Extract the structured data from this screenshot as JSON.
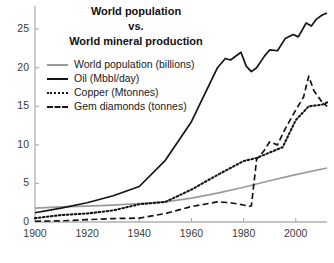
{
  "chart_data": {
    "type": "line",
    "title": "World population\nvs.\nWorld mineral production",
    "title_lines": [
      "World population",
      "vs.",
      "World mineral production"
    ],
    "xlabel": "",
    "ylabel": "",
    "xlim": [
      1900,
      2012
    ],
    "ylim": [
      0,
      28
    ],
    "xticks": [
      1900,
      1920,
      1940,
      1960,
      1980,
      2000
    ],
    "xtick_labels": [
      "1900",
      "1920",
      "1940",
      "1960",
      "1980",
      "2000"
    ],
    "yticks": [
      0,
      5,
      10,
      15,
      20,
      25
    ],
    "ytick_labels": [
      "0",
      "5",
      "10",
      "15",
      "20",
      "25"
    ],
    "grid": false,
    "legend_position": "upper left",
    "series": [
      {
        "name": "World population (billions)",
        "style": "solid",
        "color": "#9a9a9a",
        "x": [
          1900,
          1910,
          1920,
          1930,
          1940,
          1950,
          1960,
          1970,
          1980,
          1990,
          2000,
          2012
        ],
        "values": [
          1.8,
          1.95,
          2.05,
          2.2,
          2.4,
          2.6,
          3.1,
          3.75,
          4.5,
          5.35,
          6.15,
          7.0
        ]
      },
      {
        "name": "Oil (Mbbl/day)",
        "style": "solid",
        "color": "#151515",
        "x": [
          1900,
          1910,
          1920,
          1930,
          1940,
          1950,
          1960,
          1965,
          1970,
          1973,
          1975,
          1979,
          1981,
          1983,
          1985,
          1988,
          1990,
          1993,
          1996,
          1999,
          2001,
          2004,
          2006,
          2008,
          2010,
          2012
        ],
        "values": [
          1.2,
          1.8,
          2.5,
          3.4,
          4.6,
          8.0,
          13.0,
          16.5,
          20.0,
          21.2,
          21.0,
          22.0,
          20.2,
          19.5,
          20.0,
          21.5,
          22.3,
          22.2,
          23.8,
          24.3,
          24.0,
          25.8,
          25.4,
          26.3,
          26.8,
          27.1
        ]
      },
      {
        "name": "Copper (Mtonnes)",
        "style": "dotted",
        "color": "#151515",
        "x": [
          1900,
          1910,
          1920,
          1930,
          1940,
          1950,
          1960,
          1970,
          1980,
          1985,
          1990,
          1995,
          2000,
          2005,
          2010,
          2012
        ],
        "values": [
          0.5,
          0.9,
          1.1,
          1.5,
          2.3,
          2.6,
          4.2,
          6.1,
          7.9,
          8.3,
          9.0,
          9.7,
          13.2,
          15.0,
          15.2,
          15.5
        ]
      },
      {
        "name": "Gem diamonds (tonnes)",
        "style": "dashed",
        "color": "#151515",
        "x": [
          1900,
          1910,
          1920,
          1930,
          1940,
          1950,
          1960,
          1970,
          1975,
          1980,
          1982,
          1983,
          1985,
          1988,
          1990,
          1993,
          1996,
          2000,
          2003,
          2005,
          2007,
          2010,
          2012
        ],
        "values": [
          0.1,
          0.15,
          0.3,
          0.45,
          0.5,
          1.1,
          2.0,
          2.6,
          2.5,
          2.2,
          2.0,
          2.1,
          8.1,
          9.3,
          10.4,
          10.0,
          12.1,
          14.5,
          16.2,
          18.9,
          17.0,
          15.6,
          15.0
        ]
      }
    ]
  },
  "axis": {
    "line_color": "#b0b0b0",
    "tick_color": "#b0b0b0",
    "label_color": "#3a3a3a"
  },
  "background": "#ffffff"
}
